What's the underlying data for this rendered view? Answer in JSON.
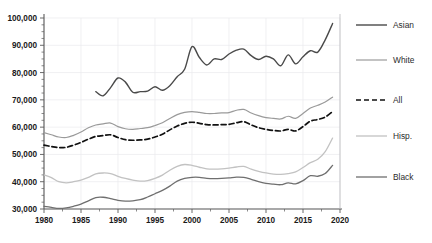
{
  "chart_data": {
    "type": "line",
    "title": "",
    "xlabel": "",
    "ylabel": "",
    "xlim": [
      1980,
      2020
    ],
    "ylim": [
      30000,
      100000
    ],
    "xticks": [
      1980,
      1985,
      1990,
      1995,
      2000,
      2005,
      2010,
      2015,
      2020
    ],
    "yticks": [
      30000,
      40000,
      50000,
      60000,
      70000,
      80000,
      90000,
      100000
    ],
    "ytick_labels": [
      "30,000",
      "40,000",
      "50,000",
      "60,000",
      "70,000",
      "80,000",
      "90,000",
      "100,000"
    ],
    "xtick_labels": [
      "1980",
      "1985",
      "1990",
      "1995",
      "2000",
      "2005",
      "2010",
      "2015",
      "2020"
    ],
    "y_minor_tick_step": 2500,
    "grid": "vertical-and-horizontal-faint",
    "legend_position": "right",
    "series": [
      {
        "name": "Asian",
        "color": "#4a4a4a",
        "width": 1.4,
        "dash": "none",
        "x": [
          1987,
          1988,
          1989,
          1990,
          1991,
          1992,
          1993,
          1994,
          1995,
          1996,
          1997,
          1998,
          1999,
          2000,
          2001,
          2002,
          2003,
          2004,
          2005,
          2006,
          2007,
          2008,
          2009,
          2010,
          2011,
          2012,
          2013,
          2014,
          2015,
          2016,
          2017,
          2018,
          2019
        ],
        "values": [
          73000,
          71500,
          74500,
          78000,
          76500,
          72800,
          73000,
          73200,
          74800,
          73500,
          75200,
          78500,
          81200,
          89500,
          85500,
          82800,
          85000,
          84800,
          86800,
          88200,
          88600,
          86200,
          84800,
          86000,
          85000,
          82500,
          86500,
          83200,
          85800,
          88000,
          87500,
          92000,
          98000
        ]
      },
      {
        "name": "White",
        "color": "#9a9a9a",
        "width": 1.2,
        "dash": "none",
        "x": [
          1980,
          1981,
          1982,
          1983,
          1984,
          1985,
          1986,
          1987,
          1988,
          1989,
          1990,
          1991,
          1992,
          1993,
          1994,
          1995,
          1996,
          1997,
          1998,
          1999,
          2000,
          2001,
          2002,
          2003,
          2004,
          2005,
          2006,
          2007,
          2008,
          2009,
          2010,
          2011,
          2012,
          2013,
          2014,
          2015,
          2016,
          2017,
          2018,
          2019
        ],
        "values": [
          58000,
          57200,
          56400,
          56200,
          57000,
          58200,
          59800,
          60800,
          61200,
          61500,
          60200,
          59400,
          59200,
          59500,
          59800,
          60600,
          61600,
          63200,
          64600,
          65400,
          65700,
          65400,
          65000,
          65000,
          65200,
          65300,
          66200,
          66500,
          65200,
          64200,
          63500,
          63200,
          63000,
          64000,
          63200,
          65000,
          67000,
          68000,
          69200,
          71000
        ]
      },
      {
        "name": "All",
        "color": "#111111",
        "width": 1.7,
        "dash": "5,3",
        "x": [
          1980,
          1981,
          1982,
          1983,
          1984,
          1985,
          1986,
          1987,
          1988,
          1989,
          1990,
          1991,
          1992,
          1993,
          1994,
          1995,
          1996,
          1997,
          1998,
          1999,
          2000,
          2001,
          2002,
          2003,
          2004,
          2005,
          2006,
          2007,
          2008,
          2009,
          2010,
          2011,
          2012,
          2013,
          2014,
          2015,
          2016,
          2017,
          2018,
          2019
        ],
        "values": [
          53400,
          52900,
          52500,
          52600,
          53400,
          54400,
          55600,
          56600,
          56900,
          57200,
          56200,
          55400,
          55200,
          55300,
          55600,
          56400,
          57400,
          59000,
          60400,
          61400,
          61800,
          61400,
          60900,
          60800,
          60900,
          61000,
          61600,
          62000,
          60800,
          59800,
          59200,
          58800,
          58600,
          59200,
          58600,
          60200,
          62200,
          62800,
          63700,
          65700
        ]
      },
      {
        "name": "Hisp.",
        "color": "#c2c2c2",
        "width": 1.3,
        "dash": "none",
        "x": [
          1980,
          1981,
          1982,
          1983,
          1984,
          1985,
          1986,
          1987,
          1988,
          1989,
          1990,
          1991,
          1992,
          1993,
          1994,
          1995,
          1996,
          1997,
          1998,
          1999,
          2000,
          2001,
          2002,
          2003,
          2004,
          2005,
          2006,
          2007,
          2008,
          2009,
          2010,
          2011,
          2012,
          2013,
          2014,
          2015,
          2016,
          2017,
          2018,
          2019
        ],
        "values": [
          42500,
          41500,
          40000,
          39600,
          40000,
          40600,
          41600,
          42900,
          43200,
          43000,
          42000,
          41200,
          40600,
          40200,
          40400,
          41200,
          42400,
          44200,
          45600,
          46300,
          46000,
          45300,
          44700,
          44600,
          44700,
          45000,
          45400,
          45600,
          44600,
          43800,
          43200,
          42800,
          42700,
          43000,
          43600,
          45200,
          47000,
          48200,
          51000,
          56000
        ]
      },
      {
        "name": "Black",
        "color": "#6f6f6f",
        "width": 1.3,
        "dash": "none",
        "x": [
          1980,
          1981,
          1982,
          1983,
          1984,
          1985,
          1986,
          1987,
          1988,
          1989,
          1990,
          1991,
          1992,
          1993,
          1994,
          1995,
          1996,
          1997,
          1998,
          1999,
          2000,
          2001,
          2002,
          2003,
          2004,
          2005,
          2006,
          2007,
          2008,
          2009,
          2010,
          2011,
          2012,
          2013,
          2014,
          2015,
          2016,
          2017,
          2018,
          2019
        ],
        "values": [
          31000,
          30600,
          30200,
          30400,
          31000,
          31800,
          33000,
          34200,
          34300,
          33800,
          33200,
          32900,
          33000,
          33400,
          34400,
          35600,
          36800,
          38400,
          40200,
          41200,
          41600,
          41600,
          41200,
          41100,
          41200,
          41400,
          41700,
          41600,
          40900,
          40000,
          39400,
          39100,
          38900,
          39600,
          39200,
          40400,
          42200,
          42000,
          43000,
          46000
        ]
      }
    ]
  },
  "legend": {
    "items": [
      {
        "label": "Asian"
      },
      {
        "label": "White"
      },
      {
        "label": "All"
      },
      {
        "label": "Hisp."
      },
      {
        "label": "Black"
      }
    ]
  }
}
